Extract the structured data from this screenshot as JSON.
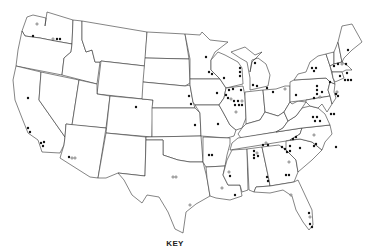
{
  "map": {
    "title": "",
    "region": "Continental United States",
    "key_label": "KEY",
    "colors": {
      "outline": "#333333",
      "dot_filled": "#111111",
      "dot_open": "#ffffff",
      "background": "#ffffff"
    },
    "markers": [
      {
        "region": "Washington",
        "x": 33,
        "y": 36,
        "type": "filled"
      },
      {
        "region": "Washington",
        "x": 37,
        "y": 24,
        "type": "open"
      },
      {
        "region": "Washington",
        "x": 53,
        "y": 39,
        "type": "open"
      },
      {
        "region": "Washington",
        "x": 57,
        "y": 39,
        "type": "filled"
      },
      {
        "region": "Washington",
        "x": 60,
        "y": 39,
        "type": "filled"
      },
      {
        "region": "California",
        "x": 28,
        "y": 98,
        "type": "filled"
      },
      {
        "region": "California",
        "x": 28,
        "y": 128,
        "type": "filled"
      },
      {
        "region": "California",
        "x": 30,
        "y": 132,
        "type": "filled"
      },
      {
        "region": "California",
        "x": 41,
        "y": 143,
        "type": "filled"
      },
      {
        "region": "California",
        "x": 44,
        "y": 142,
        "type": "filled"
      },
      {
        "region": "California",
        "x": 43,
        "y": 146,
        "type": "filled"
      },
      {
        "region": "Arizona",
        "x": 69,
        "y": 157,
        "type": "filled"
      },
      {
        "region": "Arizona",
        "x": 72,
        "y": 158,
        "type": "open"
      },
      {
        "region": "Arizona",
        "x": 75,
        "y": 158,
        "type": "open"
      },
      {
        "region": "Colorado",
        "x": 136,
        "y": 107,
        "type": "filled"
      },
      {
        "region": "Texas",
        "x": 173,
        "y": 177,
        "type": "open"
      },
      {
        "region": "Texas",
        "x": 176,
        "y": 177,
        "type": "open"
      },
      {
        "region": "Texas",
        "x": 190,
        "y": 205,
        "type": "open"
      },
      {
        "region": "Minnesota",
        "x": 206,
        "y": 57,
        "type": "filled"
      },
      {
        "region": "Minnesota",
        "x": 209,
        "y": 72,
        "type": "filled"
      },
      {
        "region": "Minnesota",
        "x": 212,
        "y": 74,
        "type": "filled"
      },
      {
        "region": "Iowa",
        "x": 217,
        "y": 93,
        "type": "filled"
      },
      {
        "region": "Nebraska",
        "x": 189,
        "y": 96,
        "type": "filled"
      },
      {
        "region": "Nebraska",
        "x": 191,
        "y": 104,
        "type": "filled"
      },
      {
        "region": "Kansas",
        "x": 195,
        "y": 125,
        "type": "filled"
      },
      {
        "region": "Missouri",
        "x": 218,
        "y": 124,
        "type": "filled"
      },
      {
        "region": "Wisconsin",
        "x": 224,
        "y": 78,
        "type": "filled"
      },
      {
        "region": "Wisconsin",
        "x": 240,
        "y": 68,
        "type": "filled"
      },
      {
        "region": "Wisconsin",
        "x": 240,
        "y": 72,
        "type": "filled"
      },
      {
        "region": "Wisconsin",
        "x": 240,
        "y": 76,
        "type": "filled"
      },
      {
        "region": "Illinois",
        "x": 226,
        "y": 95,
        "type": "filled"
      },
      {
        "region": "Illinois",
        "x": 228,
        "y": 98,
        "type": "filled"
      },
      {
        "region": "Illinois",
        "x": 231,
        "y": 99,
        "type": "open"
      },
      {
        "region": "Illinois",
        "x": 234,
        "y": 101,
        "type": "filled"
      },
      {
        "region": "Illinois",
        "x": 238,
        "y": 101,
        "type": "filled"
      },
      {
        "region": "Illinois",
        "x": 242,
        "y": 101,
        "type": "open"
      },
      {
        "region": "Illinois",
        "x": 235,
        "y": 105,
        "type": "filled"
      },
      {
        "region": "Illinois",
        "x": 239,
        "y": 105,
        "type": "filled"
      },
      {
        "region": "Illinois",
        "x": 242,
        "y": 105,
        "type": "filled"
      },
      {
        "region": "Illinois",
        "x": 236,
        "y": 112,
        "type": "open"
      },
      {
        "region": "Illinois",
        "x": 229,
        "y": 90,
        "type": "filled"
      },
      {
        "region": "Illinois",
        "x": 233,
        "y": 89,
        "type": "filled"
      },
      {
        "region": "Illinois",
        "x": 241,
        "y": 90,
        "type": "filled"
      },
      {
        "region": "Michigan",
        "x": 255,
        "y": 63,
        "type": "filled"
      },
      {
        "region": "Michigan",
        "x": 253,
        "y": 85,
        "type": "filled"
      },
      {
        "region": "Michigan",
        "x": 257,
        "y": 86,
        "type": "filled"
      },
      {
        "region": "Michigan",
        "x": 267,
        "y": 88,
        "type": "filled"
      },
      {
        "region": "Ohio",
        "x": 273,
        "y": 92,
        "type": "filled"
      },
      {
        "region": "Ohio",
        "x": 285,
        "y": 89,
        "type": "open"
      },
      {
        "region": "Pennsylvania",
        "x": 296,
        "y": 95,
        "type": "filled"
      },
      {
        "region": "Pennsylvania",
        "x": 317,
        "y": 86,
        "type": "filled"
      },
      {
        "region": "Pennsylvania",
        "x": 317,
        "y": 90,
        "type": "filled"
      },
      {
        "region": "Pennsylvania",
        "x": 317,
        "y": 94,
        "type": "filled"
      },
      {
        "region": "Pennsylvania",
        "x": 314,
        "y": 98,
        "type": "filled"
      },
      {
        "region": "Pennsylvania",
        "x": 322,
        "y": 92,
        "type": "filled"
      },
      {
        "region": "Pennsylvania",
        "x": 320,
        "y": 97,
        "type": "open"
      },
      {
        "region": "New Jersey",
        "x": 330,
        "y": 82,
        "type": "filled"
      },
      {
        "region": "New Jersey",
        "x": 336,
        "y": 94,
        "type": "filled"
      },
      {
        "region": "New Jersey",
        "x": 338,
        "y": 96,
        "type": "filled"
      },
      {
        "region": "New Jersey",
        "x": 337,
        "y": 92,
        "type": "open"
      },
      {
        "region": "New York",
        "x": 312,
        "y": 68,
        "type": "filled"
      },
      {
        "region": "New York",
        "x": 316,
        "y": 68,
        "type": "filled"
      },
      {
        "region": "New York",
        "x": 314,
        "y": 71,
        "type": "filled"
      },
      {
        "region": "Maine",
        "x": 348,
        "y": 50,
        "type": "filled"
      },
      {
        "region": "New England",
        "x": 334,
        "y": 66,
        "type": "filled"
      },
      {
        "region": "New England",
        "x": 338,
        "y": 64,
        "type": "filled"
      },
      {
        "region": "New England",
        "x": 342,
        "y": 64,
        "type": "open"
      },
      {
        "region": "New England",
        "x": 346,
        "y": 64,
        "type": "filled"
      },
      {
        "region": "New England",
        "x": 340,
        "y": 76,
        "type": "filled"
      },
      {
        "region": "New England",
        "x": 347,
        "y": 73,
        "type": "filled"
      },
      {
        "region": "New England",
        "x": 345,
        "y": 80,
        "type": "filled"
      },
      {
        "region": "New England",
        "x": 348,
        "y": 80,
        "type": "filled"
      },
      {
        "region": "New England",
        "x": 351,
        "y": 80,
        "type": "filled"
      },
      {
        "region": "Maryland",
        "x": 331,
        "y": 114,
        "type": "filled"
      },
      {
        "region": "Maryland",
        "x": 334,
        "y": 114,
        "type": "filled"
      },
      {
        "region": "Virginia",
        "x": 313,
        "y": 117,
        "type": "filled"
      },
      {
        "region": "Virginia",
        "x": 317,
        "y": 117,
        "type": "filled"
      },
      {
        "region": "Virginia",
        "x": 315,
        "y": 121,
        "type": "filled"
      },
      {
        "region": "Virginia",
        "x": 320,
        "y": 121,
        "type": "filled"
      },
      {
        "region": "North Carolina",
        "x": 314,
        "y": 135,
        "type": "open"
      },
      {
        "region": "North Carolina",
        "x": 293,
        "y": 139,
        "type": "filled"
      },
      {
        "region": "North Carolina",
        "x": 296,
        "y": 137,
        "type": "filled"
      },
      {
        "region": "North Carolina",
        "x": 300,
        "y": 148,
        "type": "filled"
      },
      {
        "region": "North Carolina",
        "x": 314,
        "y": 146,
        "type": "filled"
      },
      {
        "region": "North Carolina",
        "x": 316,
        "y": 144,
        "type": "filled"
      },
      {
        "region": "South Carolina",
        "x": 282,
        "y": 147,
        "type": "filled"
      },
      {
        "region": "South Carolina",
        "x": 285,
        "y": 149,
        "type": "filled"
      },
      {
        "region": "South Carolina",
        "x": 287,
        "y": 152,
        "type": "filled"
      },
      {
        "region": "South Carolina",
        "x": 290,
        "y": 151,
        "type": "filled"
      },
      {
        "region": "South Carolina",
        "x": 290,
        "y": 146,
        "type": "filled"
      },
      {
        "region": "South Carolina",
        "x": 289,
        "y": 162,
        "type": "open"
      },
      {
        "region": "Tennessee",
        "x": 263,
        "y": 145,
        "type": "filled"
      },
      {
        "region": "Tennessee",
        "x": 266,
        "y": 143,
        "type": "open"
      },
      {
        "region": "Tennessee",
        "x": 268,
        "y": 145,
        "type": "filled"
      },
      {
        "region": "Alabama",
        "x": 254,
        "y": 151,
        "type": "filled"
      },
      {
        "region": "Alabama",
        "x": 254,
        "y": 155,
        "type": "filled"
      },
      {
        "region": "Alabama",
        "x": 254,
        "y": 158,
        "type": "filled"
      },
      {
        "region": "Alabama",
        "x": 257,
        "y": 153,
        "type": "open"
      },
      {
        "region": "Alabama",
        "x": 258,
        "y": 156,
        "type": "filled"
      },
      {
        "region": "Alabama",
        "x": 267,
        "y": 177,
        "type": "filled"
      },
      {
        "region": "Alabama",
        "x": 268,
        "y": 181,
        "type": "filled"
      },
      {
        "region": "Georgia",
        "x": 286,
        "y": 175,
        "type": "filled"
      },
      {
        "region": "Georgia",
        "x": 289,
        "y": 175,
        "type": "filled"
      },
      {
        "region": "Arkansas",
        "x": 209,
        "y": 155,
        "type": "filled"
      },
      {
        "region": "Arkansas",
        "x": 212,
        "y": 155,
        "type": "filled"
      },
      {
        "region": "Mississippi",
        "x": 229,
        "y": 172,
        "type": "open"
      },
      {
        "region": "Mississippi",
        "x": 230,
        "y": 176,
        "type": "filled"
      },
      {
        "region": "Louisiana",
        "x": 222,
        "y": 188,
        "type": "open"
      },
      {
        "region": "Louisiana",
        "x": 235,
        "y": 195,
        "type": "filled"
      },
      {
        "region": "Florida",
        "x": 291,
        "y": 195,
        "type": "open"
      },
      {
        "region": "Florida",
        "x": 309,
        "y": 213,
        "type": "filled"
      },
      {
        "region": "Florida",
        "x": 310,
        "y": 217,
        "type": "open"
      },
      {
        "region": "Florida",
        "x": 310,
        "y": 224,
        "type": "filled"
      },
      {
        "region": "Florida",
        "x": 312,
        "y": 227,
        "type": "filled"
      },
      {
        "region": "Georgia",
        "x": 336,
        "y": 147,
        "type": "filled"
      }
    ]
  }
}
